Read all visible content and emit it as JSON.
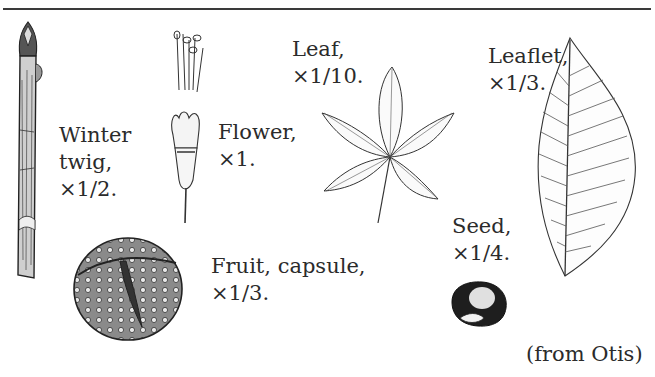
{
  "figure": {
    "credit": "(from Otis)",
    "items": [
      {
        "id": "winter-twig",
        "line1": "Winter",
        "line2": "twig,",
        "line3": "×1/2."
      },
      {
        "id": "flower",
        "line1": "Flower,",
        "line2": "×1."
      },
      {
        "id": "leaf",
        "line1": "Leaf,",
        "line2": "×1/10."
      },
      {
        "id": "leaflet",
        "line1": "Leaflet,",
        "line2": "×1/3."
      },
      {
        "id": "fruit-capsule",
        "line1": "Fruit, capsule,",
        "line2": "×1/3."
      },
      {
        "id": "seed",
        "line1": "Seed,",
        "line2": "×1/4."
      }
    ]
  },
  "colors": {
    "ink": "#2a2a2a",
    "background": "#ffffff",
    "rule": "#3a3a3a"
  }
}
